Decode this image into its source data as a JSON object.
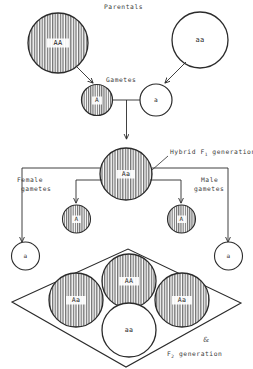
{
  "diagram": {
    "title_labels": {
      "parentals": "Parentals",
      "gametes": "Gametes",
      "hybrid_f1": "Hybrid F",
      "hybrid_f1_sub": "1",
      "hybrid_f1_tail": " generation",
      "female_gametes_line1": "Female",
      "female_gametes_line2": "gametes",
      "male_gametes_line1": "Male",
      "male_gametes_line2": "gametes",
      "f2_generation": "F",
      "f2_generation_sub": "2",
      "f2_generation_tail": " generation",
      "ampersand": "&"
    },
    "genotypes": {
      "parent_dominant": "AA",
      "parent_recessive": "aa",
      "gamete_dominant": "A",
      "gamete_recessive": "a",
      "hybrid": "Aa",
      "female_gamete_dominant": "A",
      "female_gamete_recessive": "a",
      "male_gamete_dominant": "A",
      "male_gamete_recessive": "a",
      "f2_homozygous_dominant": "AA",
      "f2_heterozygous_left": "Aa",
      "f2_heterozygous_right": "Aa",
      "f2_homozygous_recessive": "aa"
    },
    "colors": {
      "stroke": "#2b2b2b",
      "hatch": "#4a4a4a",
      "background": "#ffffff",
      "label_text": "#3a3a3a"
    },
    "ratio_note": {
      "dominant_phenotype_count": 3,
      "recessive_phenotype_count": 1
    }
  }
}
